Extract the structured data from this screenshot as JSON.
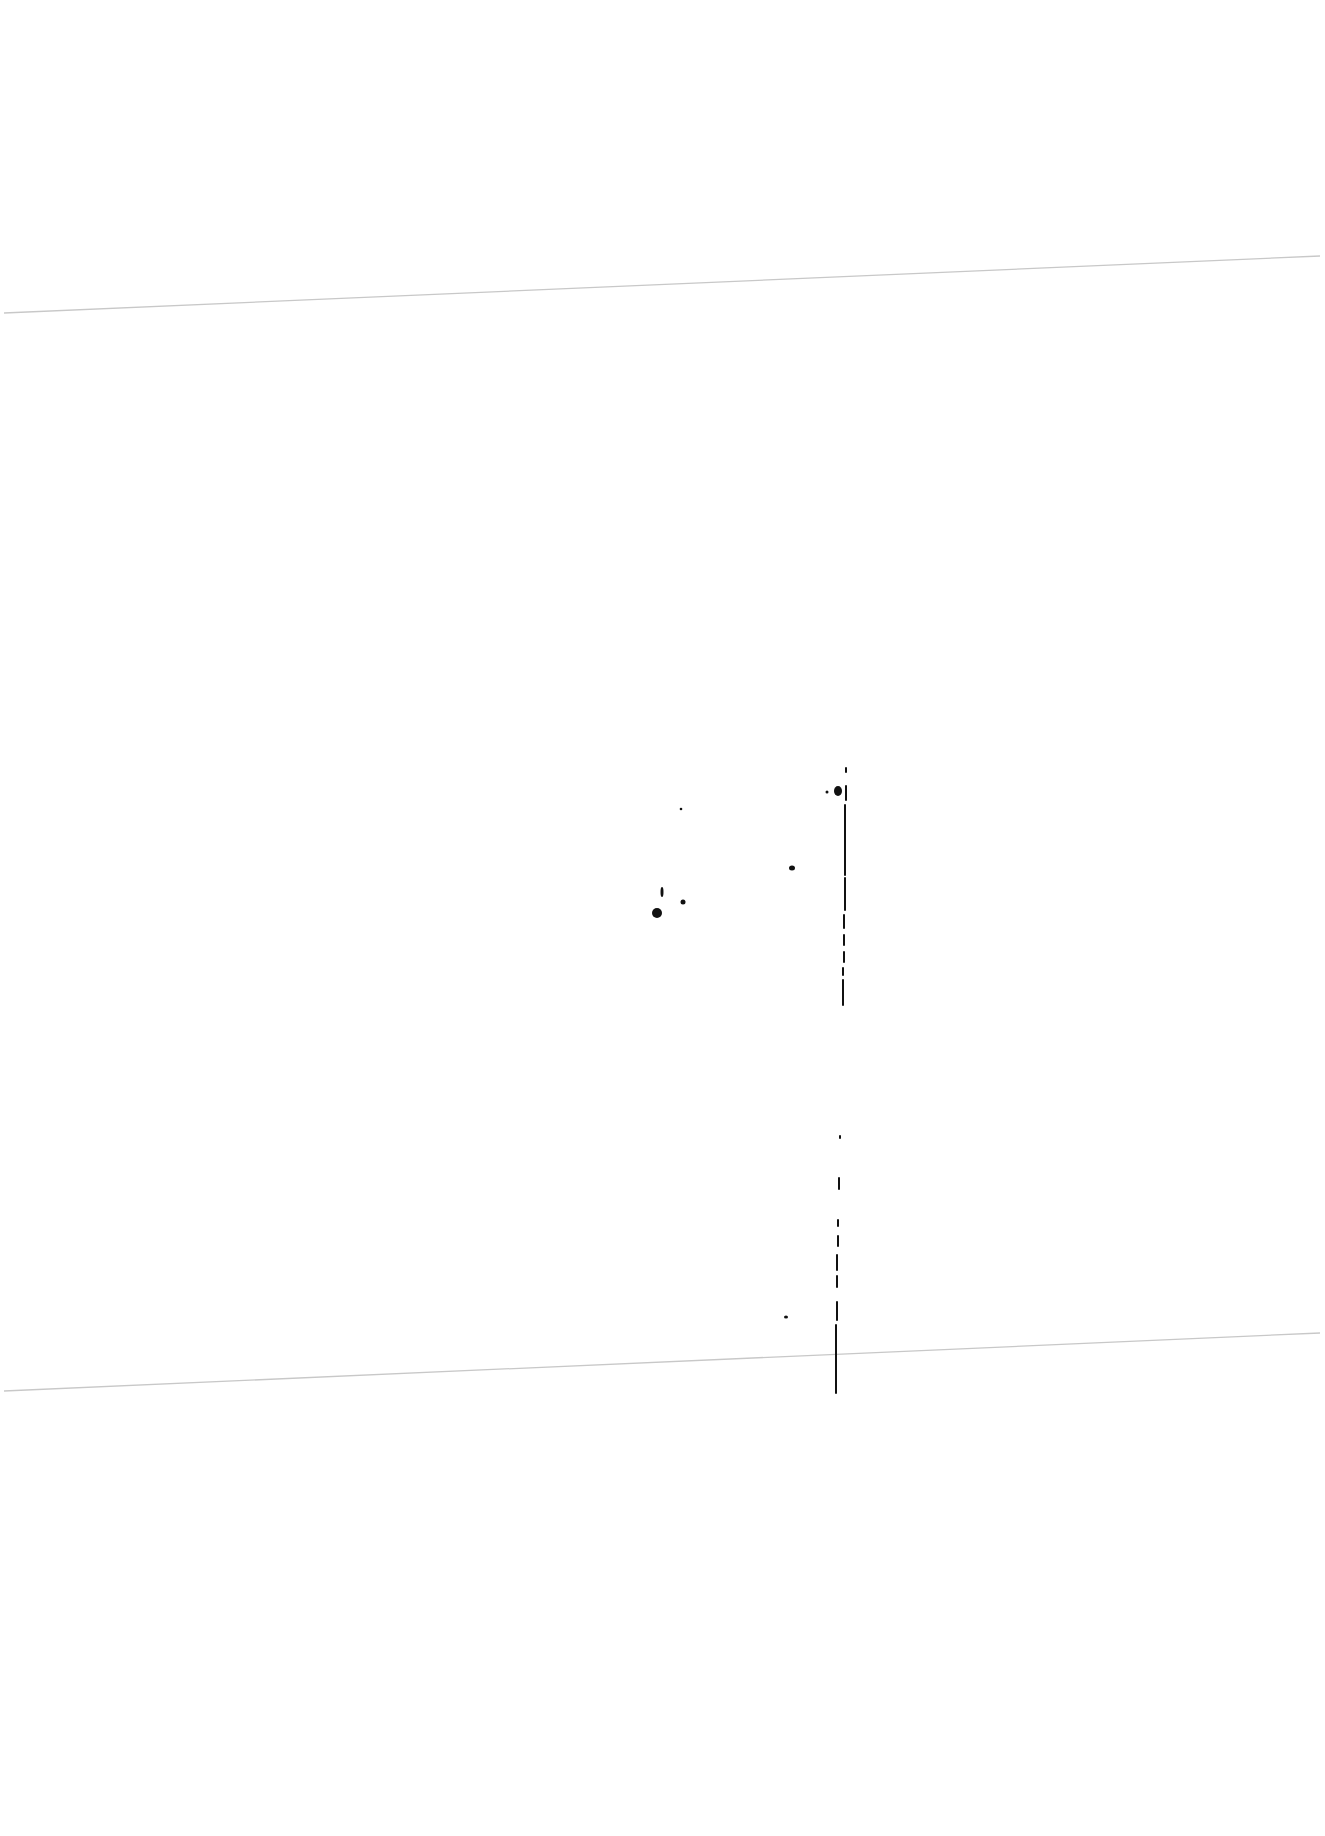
{
  "page": {
    "width": 1325,
    "height": 1836,
    "background": "#ffffff",
    "text": []
  },
  "fold_lines": [
    {
      "x1": 4,
      "y1": 313,
      "x2": 1320,
      "y2": 256,
      "color": "#c8c8c8",
      "width": 1.3
    },
    {
      "x1": 4,
      "y1": 1391,
      "x2": 1320,
      "y2": 1333,
      "color": "#c8c8c8",
      "width": 1.3
    }
  ],
  "vertical_mark": {
    "color": "#111111",
    "segments": [
      [
        846,
        768,
        846,
        772
      ],
      [
        846,
        786,
        846,
        800
      ],
      [
        845,
        805,
        845,
        875
      ],
      [
        845,
        878,
        845,
        910
      ],
      [
        844,
        915,
        844,
        928
      ],
      [
        844,
        935,
        844,
        945
      ],
      [
        844,
        952,
        844,
        962
      ],
      [
        843,
        968,
        843,
        975
      ],
      [
        843,
        980,
        843,
        1005
      ],
      [
        840,
        1136,
        840,
        1138
      ],
      [
        839,
        1178,
        839,
        1189
      ],
      [
        838,
        1220,
        838,
        1226
      ],
      [
        838,
        1236,
        838,
        1246
      ],
      [
        837,
        1255,
        837,
        1270
      ],
      [
        837,
        1276,
        837,
        1287
      ],
      [
        837,
        1302,
        837,
        1320
      ],
      [
        836,
        1325,
        836,
        1393
      ]
    ]
  },
  "speckles": [
    {
      "cx": 838,
      "cy": 791,
      "rx": 4,
      "ry": 5
    },
    {
      "cx": 827,
      "cy": 792,
      "rx": 1.5,
      "ry": 1.5
    },
    {
      "cx": 681,
      "cy": 809,
      "rx": 1.3,
      "ry": 1.3
    },
    {
      "cx": 792,
      "cy": 868,
      "rx": 3,
      "ry": 2.5
    },
    {
      "cx": 683,
      "cy": 902,
      "rx": 2.5,
      "ry": 2.5
    },
    {
      "cx": 657,
      "cy": 913,
      "rx": 5,
      "ry": 5
    },
    {
      "cx": 662,
      "cy": 892,
      "rx": 1.5,
      "ry": 5
    },
    {
      "cx": 786,
      "cy": 1317,
      "rx": 2,
      "ry": 1.6
    }
  ]
}
